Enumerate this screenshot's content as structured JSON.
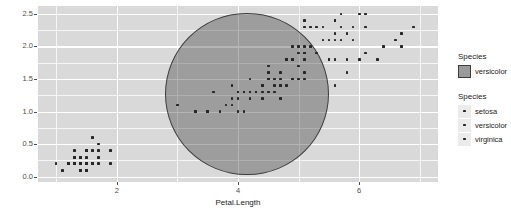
{
  "chart_data": {
    "type": "scatter",
    "title": "",
    "xlabel": "Petal.Length",
    "ylabel": "Petal.Width",
    "xlim": [
      0.7,
      7.3
    ],
    "ylim": [
      -0.08,
      2.62
    ],
    "x_ticks": [
      "2",
      "4",
      "6"
    ],
    "x_tick_values": [
      2,
      4,
      6
    ],
    "y_ticks": [
      "0.0",
      "0.5",
      "1.0",
      "1.5",
      "2.0",
      "2.5"
    ],
    "y_tick_values": [
      0.0,
      0.5,
      1.0,
      1.5,
      2.0,
      2.5
    ],
    "grid": true,
    "grid_major_color": "#ffffff",
    "panel_background": "#d9d9d9",
    "point_color": "#262626",
    "legend_position": "right",
    "annotation": {
      "shape": "ellipse",
      "label": "versicolor",
      "fill": "#9a9a9a",
      "fill_opacity": 0.38,
      "border": "#3d3d3d",
      "center_x": 4.15,
      "center_y": 1.27,
      "radius_x": 1.35,
      "radius_y": 1.25
    },
    "series": [
      {
        "name": "setosa",
        "points": [
          [
            1.4,
            0.2
          ],
          [
            1.4,
            0.2
          ],
          [
            1.3,
            0.2
          ],
          [
            1.5,
            0.2
          ],
          [
            1.4,
            0.2
          ],
          [
            1.7,
            0.4
          ],
          [
            1.4,
            0.3
          ],
          [
            1.5,
            0.2
          ],
          [
            1.4,
            0.2
          ],
          [
            1.5,
            0.1
          ],
          [
            1.5,
            0.2
          ],
          [
            1.6,
            0.2
          ],
          [
            1.4,
            0.1
          ],
          [
            1.1,
            0.1
          ],
          [
            1.2,
            0.2
          ],
          [
            1.5,
            0.4
          ],
          [
            1.3,
            0.4
          ],
          [
            1.4,
            0.3
          ],
          [
            1.7,
            0.3
          ],
          [
            1.5,
            0.3
          ],
          [
            1.7,
            0.2
          ],
          [
            1.5,
            0.4
          ],
          [
            1.0,
            0.2
          ],
          [
            1.7,
            0.5
          ],
          [
            1.9,
            0.2
          ],
          [
            1.6,
            0.2
          ],
          [
            1.6,
            0.4
          ],
          [
            1.5,
            0.2
          ],
          [
            1.4,
            0.2
          ],
          [
            1.6,
            0.2
          ],
          [
            1.6,
            0.2
          ],
          [
            1.5,
            0.4
          ],
          [
            1.5,
            0.1
          ],
          [
            1.4,
            0.2
          ],
          [
            1.5,
            0.2
          ],
          [
            1.2,
            0.2
          ],
          [
            1.3,
            0.2
          ],
          [
            1.4,
            0.1
          ],
          [
            1.3,
            0.2
          ],
          [
            1.5,
            0.2
          ],
          [
            1.3,
            0.3
          ],
          [
            1.3,
            0.3
          ],
          [
            1.3,
            0.2
          ],
          [
            1.6,
            0.6
          ],
          [
            1.9,
            0.4
          ],
          [
            1.4,
            0.3
          ],
          [
            1.6,
            0.2
          ],
          [
            1.4,
            0.2
          ],
          [
            1.5,
            0.2
          ],
          [
            1.4,
            0.2
          ]
        ]
      },
      {
        "name": "versicolor",
        "points": [
          [
            4.7,
            1.4
          ],
          [
            4.5,
            1.5
          ],
          [
            4.9,
            1.5
          ],
          [
            4.0,
            1.3
          ],
          [
            4.6,
            1.5
          ],
          [
            4.5,
            1.3
          ],
          [
            4.7,
            1.6
          ],
          [
            3.3,
            1.0
          ],
          [
            4.6,
            1.3
          ],
          [
            3.9,
            1.4
          ],
          [
            3.5,
            1.0
          ],
          [
            4.2,
            1.5
          ],
          [
            4.0,
            1.0
          ],
          [
            4.7,
            1.4
          ],
          [
            3.6,
            1.3
          ],
          [
            4.4,
            1.4
          ],
          [
            4.5,
            1.5
          ],
          [
            4.1,
            1.0
          ],
          [
            4.5,
            1.5
          ],
          [
            3.9,
            1.1
          ],
          [
            4.8,
            1.8
          ],
          [
            4.0,
            1.3
          ],
          [
            4.9,
            1.5
          ],
          [
            4.7,
            1.2
          ],
          [
            4.3,
            1.3
          ],
          [
            4.4,
            1.4
          ],
          [
            4.8,
            1.4
          ],
          [
            5.0,
            1.7
          ],
          [
            4.5,
            1.5
          ],
          [
            3.5,
            1.0
          ],
          [
            3.8,
            1.1
          ],
          [
            3.7,
            1.0
          ],
          [
            3.9,
            1.2
          ],
          [
            5.1,
            1.6
          ],
          [
            4.5,
            1.5
          ],
          [
            4.5,
            1.6
          ],
          [
            4.7,
            1.5
          ],
          [
            4.4,
            1.3
          ],
          [
            4.1,
            1.3
          ],
          [
            4.0,
            1.3
          ],
          [
            4.4,
            1.2
          ],
          [
            4.6,
            1.4
          ],
          [
            4.0,
            1.2
          ],
          [
            3.3,
            1.0
          ],
          [
            4.2,
            1.3
          ],
          [
            4.2,
            1.2
          ],
          [
            4.2,
            1.3
          ],
          [
            4.3,
            1.3
          ],
          [
            3.0,
            1.1
          ],
          [
            4.1,
            1.3
          ]
        ]
      },
      {
        "name": "virginica",
        "points": [
          [
            6.0,
            2.5
          ],
          [
            5.1,
            1.9
          ],
          [
            5.9,
            2.1
          ],
          [
            5.6,
            1.8
          ],
          [
            5.8,
            2.2
          ],
          [
            6.6,
            2.1
          ],
          [
            4.5,
            1.7
          ],
          [
            6.3,
            1.8
          ],
          [
            5.8,
            1.8
          ],
          [
            6.1,
            2.5
          ],
          [
            5.1,
            2.0
          ],
          [
            5.3,
            1.9
          ],
          [
            5.5,
            2.1
          ],
          [
            5.0,
            2.0
          ],
          [
            5.1,
            2.4
          ],
          [
            5.3,
            2.3
          ],
          [
            5.5,
            1.8
          ],
          [
            6.7,
            2.2
          ],
          [
            6.9,
            2.3
          ],
          [
            5.0,
            1.5
          ],
          [
            5.7,
            2.3
          ],
          [
            4.9,
            2.0
          ],
          [
            6.7,
            2.0
          ],
          [
            4.9,
            1.8
          ],
          [
            5.7,
            2.1
          ],
          [
            6.0,
            1.8
          ],
          [
            4.8,
            1.8
          ],
          [
            4.9,
            1.8
          ],
          [
            5.6,
            2.1
          ],
          [
            5.8,
            1.6
          ],
          [
            6.1,
            1.9
          ],
          [
            6.4,
            2.0
          ],
          [
            5.6,
            2.2
          ],
          [
            5.1,
            1.5
          ],
          [
            5.6,
            1.4
          ],
          [
            6.1,
            2.3
          ],
          [
            5.6,
            2.4
          ],
          [
            5.5,
            1.8
          ],
          [
            4.8,
            1.8
          ],
          [
            5.4,
            2.1
          ],
          [
            5.6,
            2.4
          ],
          [
            5.1,
            2.3
          ],
          [
            5.1,
            1.9
          ],
          [
            5.9,
            2.3
          ],
          [
            5.7,
            2.5
          ],
          [
            5.2,
            2.3
          ],
          [
            5.0,
            1.9
          ],
          [
            5.2,
            2.0
          ],
          [
            5.4,
            2.3
          ],
          [
            5.1,
            1.8
          ]
        ]
      }
    ]
  },
  "axes": {
    "x_title": "Petal.Length",
    "y_title": "Petal.Width"
  },
  "legends": [
    {
      "id": "fill",
      "title": "Species",
      "key_type": "swatch",
      "items": [
        {
          "label": "versicolor"
        }
      ]
    },
    {
      "id": "colour",
      "title": "Species",
      "key_type": "point",
      "items": [
        {
          "label": "setosa"
        },
        {
          "label": "versicolor"
        },
        {
          "label": "virginica"
        }
      ]
    }
  ]
}
